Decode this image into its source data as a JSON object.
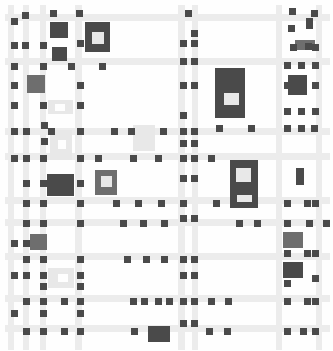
{
  "artwork": {
    "description": "Grayscale grid painting of light stripes with small dark squares and larger gray blocks",
    "colors": {
      "background": "#fefefe",
      "stripe": "#ececec",
      "stripe_light": "#f2f2f2",
      "dark": "#4a4a4a",
      "medium": "#6e6e6e",
      "light_block": "#e8e8e8"
    },
    "h_stripes": [
      {
        "y": 14,
        "h": 7,
        "x": 5,
        "w": 325
      },
      {
        "y": 58,
        "h": 7,
        "x": 5,
        "w": 325
      },
      {
        "y": 128,
        "h": 7,
        "x": 5,
        "w": 325
      },
      {
        "y": 153,
        "h": 7,
        "x": 5,
        "w": 325
      },
      {
        "y": 197,
        "h": 7,
        "x": 5,
        "w": 325
      },
      {
        "y": 219,
        "h": 7,
        "x": 5,
        "w": 325
      },
      {
        "y": 253,
        "h": 7,
        "x": 5,
        "w": 325
      },
      {
        "y": 295,
        "h": 7,
        "x": 5,
        "w": 325
      },
      {
        "y": 325,
        "h": 7,
        "x": 5,
        "w": 325
      }
    ],
    "v_stripes": [
      {
        "x": 8,
        "w": 6,
        "y": 5,
        "h": 345
      },
      {
        "x": 23,
        "w": 6,
        "y": 5,
        "h": 345
      },
      {
        "x": 40,
        "w": 6,
        "y": 5,
        "h": 345
      },
      {
        "x": 75,
        "w": 7,
        "y": 5,
        "h": 345
      },
      {
        "x": 178,
        "w": 7,
        "y": 5,
        "h": 345
      },
      {
        "x": 192,
        "w": 6,
        "y": 5,
        "h": 345
      },
      {
        "x": 276,
        "w": 6,
        "y": 5,
        "h": 345
      },
      {
        "x": 316,
        "w": 6,
        "y": 5,
        "h": 345
      }
    ],
    "blocks": [
      {
        "x": 50,
        "y": 22,
        "w": 18,
        "h": 16,
        "c": "dark"
      },
      {
        "x": 85,
        "y": 22,
        "w": 25,
        "h": 30,
        "c": "dark"
      },
      {
        "x": 92,
        "y": 32,
        "w": 12,
        "h": 12,
        "c": "light_block"
      },
      {
        "x": 52,
        "y": 47,
        "w": 15,
        "h": 14,
        "c": "dark"
      },
      {
        "x": 27,
        "y": 75,
        "w": 18,
        "h": 18,
        "c": "medium"
      },
      {
        "x": 48,
        "y": 100,
        "w": 25,
        "h": 14,
        "c": "light_block"
      },
      {
        "x": 55,
        "y": 104,
        "w": 10,
        "h": 7,
        "c": "background"
      },
      {
        "x": 50,
        "y": 130,
        "w": 22,
        "h": 30,
        "c": "light_block"
      },
      {
        "x": 58,
        "y": 140,
        "w": 8,
        "h": 9,
        "c": "background"
      },
      {
        "x": 133,
        "y": 125,
        "w": 22,
        "h": 26,
        "c": "light_block"
      },
      {
        "x": 215,
        "y": 68,
        "w": 30,
        "h": 50,
        "c": "dark"
      },
      {
        "x": 224,
        "y": 93,
        "w": 15,
        "h": 12,
        "c": "light_block"
      },
      {
        "x": 288,
        "y": 75,
        "w": 19,
        "h": 20,
        "c": "dark"
      },
      {
        "x": 295,
        "y": 40,
        "w": 20,
        "h": 10,
        "c": "medium"
      },
      {
        "x": 230,
        "y": 160,
        "w": 28,
        "h": 48,
        "c": "dark"
      },
      {
        "x": 236,
        "y": 168,
        "w": 15,
        "h": 14,
        "c": "light_block"
      },
      {
        "x": 237,
        "y": 195,
        "w": 15,
        "h": 7,
        "c": "light_block"
      },
      {
        "x": 296,
        "y": 168,
        "w": 8,
        "h": 17,
        "c": "dark"
      },
      {
        "x": 47,
        "y": 174,
        "w": 27,
        "h": 22,
        "c": "dark"
      },
      {
        "x": 95,
        "y": 170,
        "w": 22,
        "h": 25,
        "c": "medium"
      },
      {
        "x": 101,
        "y": 176,
        "w": 11,
        "h": 11,
        "c": "light_block"
      },
      {
        "x": 30,
        "y": 234,
        "w": 17,
        "h": 16,
        "c": "medium"
      },
      {
        "x": 48,
        "y": 268,
        "w": 26,
        "h": 20,
        "c": "light_block"
      },
      {
        "x": 58,
        "y": 274,
        "w": 10,
        "h": 8,
        "c": "background"
      },
      {
        "x": 283,
        "y": 232,
        "w": 20,
        "h": 16,
        "c": "medium"
      },
      {
        "x": 283,
        "y": 262,
        "w": 20,
        "h": 16,
        "c": "dark"
      },
      {
        "x": 148,
        "y": 326,
        "w": 22,
        "h": 16,
        "c": "dark"
      }
    ],
    "dots": [
      [
        22,
        12
      ],
      [
        50,
        10
      ],
      [
        11,
        18
      ],
      [
        76,
        10
      ],
      [
        185,
        10
      ],
      [
        289,
        8
      ],
      [
        311,
        10
      ],
      [
        306,
        18
      ],
      [
        11,
        42
      ],
      [
        22,
        42
      ],
      [
        40,
        42
      ],
      [
        77,
        40
      ],
      [
        191,
        30
      ],
      [
        306,
        22
      ],
      [
        288,
        25
      ],
      [
        305,
        43
      ],
      [
        11,
        63
      ],
      [
        40,
        63
      ],
      [
        68,
        63
      ],
      [
        99,
        63
      ],
      [
        180,
        40
      ],
      [
        191,
        40
      ],
      [
        290,
        44
      ],
      [
        312,
        44
      ],
      [
        11,
        82
      ],
      [
        77,
        82
      ],
      [
        180,
        58
      ],
      [
        191,
        58
      ],
      [
        284,
        62
      ],
      [
        298,
        62
      ],
      [
        312,
        62
      ],
      [
        11,
        102
      ],
      [
        40,
        102
      ],
      [
        77,
        102
      ],
      [
        180,
        82
      ],
      [
        191,
        82
      ],
      [
        284,
        82
      ],
      [
        312,
        82
      ],
      [
        11,
        128
      ],
      [
        23,
        128
      ],
      [
        48,
        128
      ],
      [
        77,
        128
      ],
      [
        111,
        128
      ],
      [
        128,
        128
      ],
      [
        160,
        128
      ],
      [
        180,
        112
      ],
      [
        180,
        128
      ],
      [
        191,
        128
      ],
      [
        216,
        125
      ],
      [
        248,
        125
      ],
      [
        284,
        108
      ],
      [
        298,
        108
      ],
      [
        312,
        108
      ],
      [
        41,
        138
      ],
      [
        41,
        122
      ],
      [
        180,
        140
      ],
      [
        191,
        140
      ],
      [
        11,
        155
      ],
      [
        23,
        155
      ],
      [
        40,
        155
      ],
      [
        77,
        155
      ],
      [
        95,
        155
      ],
      [
        130,
        155
      ],
      [
        155,
        155
      ],
      [
        180,
        155
      ],
      [
        191,
        155
      ],
      [
        208,
        155
      ],
      [
        284,
        125
      ],
      [
        298,
        125
      ],
      [
        311,
        125
      ],
      [
        23,
        180
      ],
      [
        40,
        180
      ],
      [
        77,
        180
      ],
      [
        180,
        175
      ],
      [
        191,
        175
      ],
      [
        23,
        200
      ],
      [
        40,
        200
      ],
      [
        77,
        200
      ],
      [
        113,
        200
      ],
      [
        135,
        200
      ],
      [
        158,
        200
      ],
      [
        180,
        200
      ],
      [
        213,
        200
      ],
      [
        284,
        200
      ],
      [
        304,
        200
      ],
      [
        312,
        200
      ],
      [
        23,
        220
      ],
      [
        40,
        220
      ],
      [
        77,
        220
      ],
      [
        120,
        220
      ],
      [
        140,
        220
      ],
      [
        161,
        220
      ],
      [
        236,
        220
      ],
      [
        254,
        220
      ],
      [
        284,
        220
      ],
      [
        306,
        220
      ],
      [
        323,
        220
      ],
      [
        11,
        240
      ],
      [
        23,
        240
      ],
      [
        180,
        215
      ],
      [
        191,
        215
      ],
      [
        284,
        250
      ],
      [
        304,
        250
      ],
      [
        312,
        250
      ],
      [
        23,
        256
      ],
      [
        40,
        256
      ],
      [
        77,
        256
      ],
      [
        124,
        256
      ],
      [
        143,
        256
      ],
      [
        161,
        256
      ],
      [
        180,
        256
      ],
      [
        191,
        256
      ],
      [
        11,
        272
      ],
      [
        23,
        272
      ],
      [
        40,
        272
      ],
      [
        77,
        272
      ],
      [
        180,
        272
      ],
      [
        191,
        272
      ],
      [
        312,
        275
      ],
      [
        40,
        283
      ],
      [
        77,
        283
      ],
      [
        284,
        280
      ],
      [
        23,
        298
      ],
      [
        40,
        298
      ],
      [
        61,
        298
      ],
      [
        77,
        298
      ],
      [
        130,
        298
      ],
      [
        141,
        298
      ],
      [
        155,
        298
      ],
      [
        166,
        298
      ],
      [
        180,
        298
      ],
      [
        191,
        298
      ],
      [
        208,
        298
      ],
      [
        225,
        298
      ],
      [
        284,
        298
      ],
      [
        304,
        298
      ],
      [
        312,
        298
      ],
      [
        11,
        310
      ],
      [
        40,
        310
      ],
      [
        77,
        310
      ],
      [
        180,
        320
      ],
      [
        191,
        320
      ],
      [
        23,
        328
      ],
      [
        40,
        328
      ],
      [
        61,
        328
      ],
      [
        77,
        328
      ],
      [
        131,
        328
      ],
      [
        206,
        328
      ],
      [
        224,
        328
      ],
      [
        284,
        328
      ],
      [
        300,
        328
      ],
      [
        312,
        328
      ]
    ]
  }
}
